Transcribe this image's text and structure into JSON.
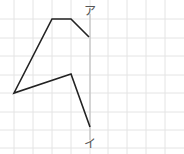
{
  "figure": {
    "labels": {
      "top": "ア",
      "bottom": "イ"
    },
    "colors": {
      "grid": "#e4e4e4",
      "polyline": "#222222",
      "axis_line": "#b8b8b8",
      "label": "#555555"
    },
    "grid": {
      "spacing_px": 18.8,
      "vertical_x": [
        14,
        33,
        52,
        71,
        90,
        108,
        127,
        146,
        165
      ],
      "horizontal_y": [
        19,
        38,
        56,
        75,
        93,
        112,
        130,
        148
      ]
    },
    "polyline_points": [
      [
        89,
        37
      ],
      [
        71,
        19
      ],
      [
        52,
        19
      ],
      [
        14,
        93
      ],
      [
        71,
        74
      ],
      [
        90,
        127
      ]
    ],
    "symmetry_line": {
      "x": 90,
      "y1": 14,
      "y2": 140
    }
  }
}
